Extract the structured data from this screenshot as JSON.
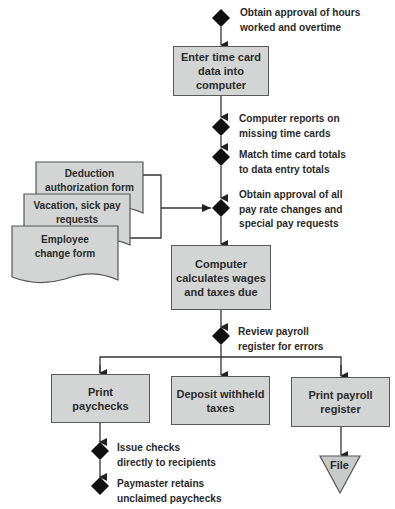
{
  "diagram": {
    "type": "payroll-flowchart",
    "colors": {
      "box_fill": "#d3d5d4",
      "stroke": "#333333",
      "diamond": "#111111",
      "text": "#2a2a2a"
    },
    "control_points": [
      {
        "id": "approve-hours",
        "lines": [
          "Obtain approval of hours",
          "worked and overtime"
        ]
      },
      {
        "id": "missing-cards",
        "lines": [
          "Computer reports on",
          "missing time cards"
        ]
      },
      {
        "id": "match-totals",
        "lines": [
          "Match time card totals",
          "to data entry totals"
        ]
      },
      {
        "id": "approve-rates",
        "lines": [
          "Obtain approval of all",
          "pay rate changes and",
          "special pay requests"
        ]
      },
      {
        "id": "review-register",
        "lines": [
          "Review payroll",
          "register for errors"
        ]
      },
      {
        "id": "issue-checks",
        "lines": [
          "Issue checks",
          "directly to recipients"
        ]
      },
      {
        "id": "paymaster",
        "lines": [
          "Paymaster retains",
          "unclaimed paychecks"
        ]
      }
    ],
    "processes": [
      {
        "id": "enter-time",
        "lines": [
          "Enter time card",
          "data into computer"
        ]
      },
      {
        "id": "calculate",
        "lines": [
          "Computer",
          "calculates wages",
          "and taxes due"
        ]
      },
      {
        "id": "print-paychecks",
        "lines": [
          "Print",
          "paychecks"
        ]
      },
      {
        "id": "deposit-taxes",
        "lines": [
          "Deposit withheld",
          "taxes"
        ]
      },
      {
        "id": "print-register",
        "lines": [
          "Print payroll",
          "register"
        ]
      }
    ],
    "documents": [
      {
        "id": "deduction-form",
        "lines": [
          "Deduction",
          "authorization form"
        ]
      },
      {
        "id": "vacation-form",
        "lines": [
          "Vacation, sick pay",
          "requests"
        ]
      },
      {
        "id": "employee-form",
        "lines": [
          "Employee",
          "change form"
        ]
      }
    ],
    "storage": {
      "id": "file",
      "label": "File"
    }
  }
}
